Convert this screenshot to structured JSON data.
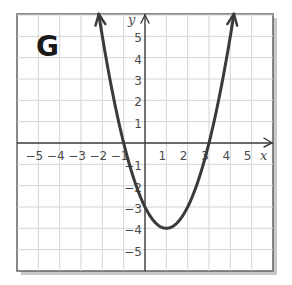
{
  "panel_label": "G",
  "colors": {
    "curve": "#3a3a3a",
    "grid": "#d4d4d4",
    "frame": "#6b6b6b",
    "background": "#ffffff"
  },
  "axes": {
    "x_label": "x",
    "y_label": "y",
    "x_ticks": [
      "−5",
      "−4",
      "−3",
      "−2",
      "−1",
      "1",
      "2",
      "3",
      "4",
      "5"
    ],
    "y_ticks": [
      "5",
      "4",
      "3",
      "2",
      "1",
      "−1",
      "−2",
      "−3",
      "−4",
      "−5"
    ]
  },
  "chart_data": {
    "type": "line",
    "title": "G",
    "xlabel": "x",
    "ylabel": "y",
    "xlim": [
      -6,
      6
    ],
    "ylim": [
      -6,
      6
    ],
    "grid": true,
    "function": "y = x^2 - 2x - 3",
    "vertex": [
      1,
      -4
    ],
    "y_intercept": -3,
    "x_intercepts": [
      -1,
      3
    ],
    "arrows_on_ends": true,
    "x_tick_labels": [
      -5,
      -4,
      -3,
      -2,
      -1,
      1,
      2,
      3,
      4,
      5
    ],
    "y_tick_labels": [
      5,
      4,
      3,
      2,
      1,
      -1,
      -2,
      -3,
      -4,
      -5
    ],
    "series": [
      {
        "name": "parabola",
        "x": [
          -1.8,
          -1.5,
          -1,
          -0.5,
          0,
          0.5,
          1,
          1.5,
          2,
          2.5,
          3,
          3.5,
          4,
          4.5
        ],
        "y": [
          3.84,
          2.25,
          0,
          -1.75,
          -3,
          -3.75,
          -4,
          -3.75,
          -3,
          -1.75,
          0,
          2.25,
          5,
          8.25
        ]
      }
    ]
  }
}
